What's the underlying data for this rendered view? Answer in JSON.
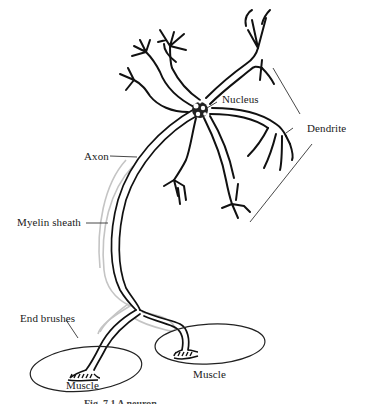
{
  "diagram": {
    "labels": {
      "nucleus": "Nucleus",
      "dendrite": "Dendrite",
      "axon": "Axon",
      "myelin_sheath": "Myelin sheath",
      "end_brushes": "End brushes",
      "muscle_left": "Muscle",
      "muscle_right": "Muscle"
    },
    "caption": "Fig. 7.1 A neuron",
    "colors": {
      "line": "#111111",
      "myelin": "#bdbdbd",
      "leader": "#333333",
      "background": "#ffffff"
    }
  }
}
